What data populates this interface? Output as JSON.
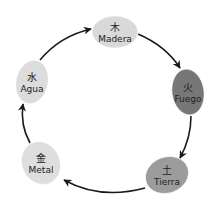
{
  "diagram": {
    "type": "cycle",
    "direction": "clockwise",
    "nodes": [
      {
        "id": "madera",
        "char": "木",
        "label": "Madera",
        "fill": "#d9d9d9",
        "cx": 115,
        "cy": 32,
        "rx": 23,
        "ry": 16,
        "rot": 0
      },
      {
        "id": "fuego",
        "char": "火",
        "label": "Fuego",
        "fill": "#777777",
        "cx": 188,
        "cy": 92,
        "rx": 16,
        "ry": 23,
        "rot": -8
      },
      {
        "id": "tierra",
        "char": "土",
        "label": "Tierra",
        "fill": "#9c9c9c",
        "cx": 167,
        "cy": 175,
        "rx": 22,
        "ry": 18,
        "rot": -20
      },
      {
        "id": "metal",
        "char": "金",
        "label": "Metal",
        "fill": "#dedede",
        "cx": 41,
        "cy": 163,
        "rx": 19,
        "ry": 22,
        "rot": -25
      },
      {
        "id": "agua",
        "char": "水",
        "label": "Agua",
        "fill": "#dcdcdc",
        "cx": 32,
        "cy": 82,
        "rx": 16,
        "ry": 22,
        "rot": 12
      }
    ],
    "edges": [
      {
        "from": "madera",
        "to": "fuego"
      },
      {
        "from": "fuego",
        "to": "tierra"
      },
      {
        "from": "tierra",
        "to": "metal"
      },
      {
        "from": "metal",
        "to": "agua"
      },
      {
        "from": "agua",
        "to": "madera"
      }
    ],
    "arrow_color": "#1a1a1a"
  }
}
